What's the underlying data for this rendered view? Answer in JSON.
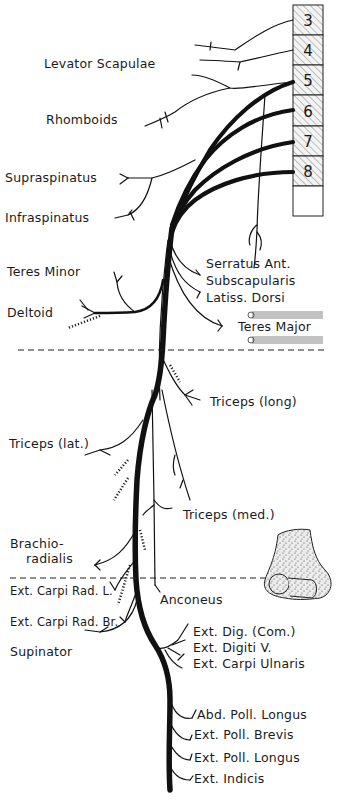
{
  "diagram": {
    "spinal_segments": [
      "3",
      "4",
      "5",
      "6",
      "7",
      "8",
      ""
    ],
    "labels_left": {
      "levator_scapulae": "Levator Scapulae",
      "rhomboids": "Rhomboids",
      "supraspinatus": "Supraspinatus",
      "infraspinatus": "Infraspinatus",
      "teres_minor": "Teres Minor",
      "deltoid": "Deltoid",
      "triceps_lat": "Triceps (lat.)",
      "brachioradialis_1": "Brachio-",
      "brachioradialis_2": "radialis",
      "ext_carpi_rad_l": "Ext. Carpi Rad. L.",
      "ext_carpi_rad_br": "Ext. Carpi Rad. Br.",
      "supinator": "Supinator"
    },
    "labels_right": {
      "serratus_ant": "Serratus Ant.",
      "subscapularis": "Subscapularis",
      "latiss_dorsi": "Latiss. Dorsi",
      "teres_major": "Teres Major",
      "triceps_long": "Triceps (long)",
      "triceps_med": "Triceps (med.)",
      "anconeus": "Anconeus",
      "ext_dig_com": "Ext. Dig. (Com.)",
      "ext_digiti_v": "Ext. Digiti V.",
      "ext_carpi_ulnaris": "Ext. Carpi Ulnaris",
      "abd_poll_longus": "Abd. Poll. Longus",
      "ext_poll_brevis": "Ext. Poll. Brevis",
      "ext_poll_longus": "Ext. Poll. Longus",
      "ext_indicis": "Ext. Indicis"
    }
  }
}
